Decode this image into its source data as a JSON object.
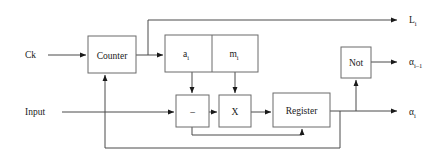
{
  "diagram": {
    "canvas": {
      "width": 442,
      "height": 168
    },
    "colors": {
      "background": "#ffffff",
      "wire": "#4a4a4a",
      "box_border": "#6b6b6b",
      "text": "#1a1a1a",
      "arrowhead": "#1a1a1a"
    },
    "blocks": [
      {
        "id": "counter",
        "label": "Counter",
        "x": 88,
        "y": 36,
        "w": 48,
        "h": 37
      },
      {
        "id": "memory",
        "label": "",
        "x": 165,
        "y": 35,
        "w": 93,
        "h": 37
      },
      {
        "id": "cell_a",
        "label": "a",
        "sub": "i",
        "x": 165,
        "y": 35,
        "w": 47,
        "h": 37
      },
      {
        "id": "cell_m",
        "label": "m",
        "sub": "i",
        "x": 212,
        "y": 35,
        "w": 46,
        "h": 37
      },
      {
        "id": "subtract",
        "label": "–",
        "x": 176,
        "y": 95,
        "w": 33,
        "h": 32
      },
      {
        "id": "multiply",
        "label": "X",
        "x": 219,
        "y": 95,
        "w": 32,
        "h": 32
      },
      {
        "id": "register",
        "label": "Register",
        "x": 273,
        "y": 93,
        "w": 57,
        "h": 34
      },
      {
        "id": "not",
        "label": "Not",
        "x": 341,
        "y": 47,
        "w": 30,
        "h": 31
      }
    ],
    "io_labels": [
      {
        "id": "ck",
        "text": "Ck",
        "sub": "",
        "x": 25,
        "y": 58
      },
      {
        "id": "input",
        "text": "Input",
        "sub": "",
        "x": 25,
        "y": 115
      },
      {
        "id": "l_i",
        "text": "L",
        "sub": "i",
        "x": 409,
        "y": 23
      },
      {
        "id": "alpha_im1",
        "text": "α",
        "sub": "i–1",
        "x": 409,
        "y": 65
      },
      {
        "id": "alpha_i",
        "text": "α",
        "sub": "i",
        "x": 409,
        "y": 115
      }
    ],
    "connections": [
      {
        "id": "ck-to-counter",
        "from": "Ck input",
        "to": "Counter"
      },
      {
        "id": "counter-to-memory",
        "from": "Counter",
        "to": "a_i / m_i block"
      },
      {
        "id": "counter-to-l",
        "from": "Counter",
        "to": "L_i output"
      },
      {
        "id": "a-to-subtract",
        "from": "a_i cell",
        "to": "subtract block"
      },
      {
        "id": "m-to-multiply",
        "from": "m_i cell",
        "to": "multiply block"
      },
      {
        "id": "input-to-subtract",
        "from": "Input",
        "to": "subtract block"
      },
      {
        "id": "subtract-to-multiply",
        "from": "subtract block",
        "to": "multiply block"
      },
      {
        "id": "multiply-to-register",
        "from": "multiply block",
        "to": "Register"
      },
      {
        "id": "register-to-alpha",
        "from": "Register",
        "to": "alpha_i output"
      },
      {
        "id": "register-to-not",
        "from": "Register",
        "to": "Not block"
      },
      {
        "id": "not-to-alpha-prev",
        "from": "Not block",
        "to": "alpha_i-1 output"
      },
      {
        "id": "feedback-to-counter",
        "from": "Register output",
        "to": "Counter bottom"
      },
      {
        "id": "feedback-to-register",
        "from": "subtract output",
        "to": "Register bottom"
      }
    ]
  }
}
